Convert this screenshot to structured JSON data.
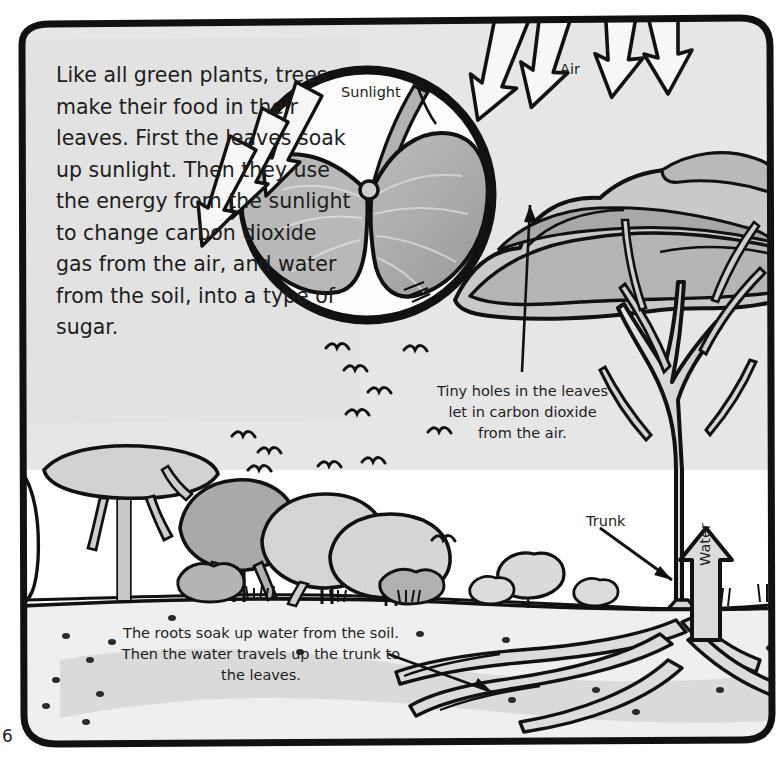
{
  "page": {
    "page_number": "6",
    "background_color": "#ffffff",
    "ink_color": "#1d1d1b"
  },
  "body_text": "Like all green plants, trees make their food in their leaves. First the leaves soak up sunlight. Then they use the energy from the sunlight to change carbon dioxide gas from the air, and water from the soil, into a type of sugar.",
  "labels": {
    "sunlight": "Sunlight",
    "air": "Air",
    "trunk": "Trunk",
    "water": "Water"
  },
  "captions": {
    "tiny_holes": "Tiny holes in the leaves let in carbon dioxide from the air.",
    "roots": "The roots soak up water from the soil. Then the water travels up the trunk to the leaves."
  },
  "palette": {
    "outline": "#111111",
    "sky": "#e3e3e3",
    "canopy_light": "#cccccc",
    "canopy_mid": "#b8b8b8",
    "canopy_dark": "#a6a6a6",
    "trunk": "#d8d8d8",
    "soil_light": "#ededed",
    "soil_shadow": "#d2d2d2",
    "leaf": "#b0b0b0",
    "leaf_dark": "#9a9a9a",
    "arrow_fill": "#f4f4f4",
    "text_panel": "#e0e0e0"
  },
  "scene": {
    "sunlight_arrows_in_magnifier": 3,
    "air_arrows_over_canopy": 4,
    "background_trees": 5,
    "birds": 12
  }
}
